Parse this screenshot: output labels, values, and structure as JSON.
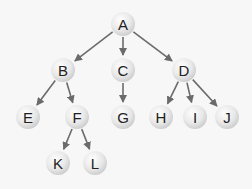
{
  "diagram": {
    "type": "tree",
    "colors": {
      "background": "#f7f7f7",
      "node_fill_light": "#ffffff",
      "node_fill_dark": "#d4d4d4",
      "edge": "#6b6b6b",
      "label": "#222222"
    },
    "nodes": [
      {
        "id": "A",
        "label": "A",
        "x": 123,
        "y": 24
      },
      {
        "id": "B",
        "label": "B",
        "x": 63,
        "y": 70
      },
      {
        "id": "C",
        "label": "C",
        "x": 123,
        "y": 70
      },
      {
        "id": "D",
        "label": "D",
        "x": 184,
        "y": 70
      },
      {
        "id": "E",
        "label": "E",
        "x": 28,
        "y": 117
      },
      {
        "id": "F",
        "label": "F",
        "x": 77,
        "y": 117
      },
      {
        "id": "G",
        "label": "G",
        "x": 123,
        "y": 117
      },
      {
        "id": "H",
        "label": "H",
        "x": 161,
        "y": 117
      },
      {
        "id": "I",
        "label": "I",
        "x": 195,
        "y": 117
      },
      {
        "id": "J",
        "label": "J",
        "x": 227,
        "y": 117
      },
      {
        "id": "K",
        "label": "K",
        "x": 58,
        "y": 163
      },
      {
        "id": "L",
        "label": "L",
        "x": 95,
        "y": 163
      }
    ],
    "edges": [
      {
        "from": "A",
        "to": "B"
      },
      {
        "from": "A",
        "to": "C"
      },
      {
        "from": "A",
        "to": "D"
      },
      {
        "from": "B",
        "to": "E"
      },
      {
        "from": "B",
        "to": "F"
      },
      {
        "from": "C",
        "to": "G"
      },
      {
        "from": "D",
        "to": "H"
      },
      {
        "from": "D",
        "to": "I"
      },
      {
        "from": "D",
        "to": "J"
      },
      {
        "from": "F",
        "to": "K"
      },
      {
        "from": "F",
        "to": "L"
      }
    ]
  }
}
